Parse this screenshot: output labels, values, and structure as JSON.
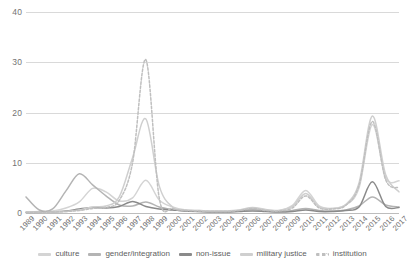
{
  "chart_data": {
    "type": "line",
    "title": "",
    "xlabel": "",
    "ylabel": "",
    "ylim": [
      0,
      40
    ],
    "yticks": [
      0,
      10,
      20,
      30,
      40
    ],
    "grid": true,
    "legend_position": "bottom",
    "categories": [
      "1989",
      "1990",
      "1991",
      "1992",
      "1993",
      "1994",
      "1995",
      "1996",
      "1997",
      "1998",
      "1999",
      "2000",
      "2001",
      "2002",
      "2003",
      "2004",
      "2005",
      "2006",
      "2007",
      "2008",
      "2009",
      "2010",
      "2011",
      "2012",
      "2013",
      "2014",
      "2015",
      "2016",
      "2017"
    ],
    "series": [
      {
        "name": "culture",
        "color": "#d4d4d4",
        "style": "solid",
        "values": [
          0.2,
          0.3,
          0.4,
          1.0,
          2.2,
          4.9,
          4.2,
          2.4,
          3.0,
          6.5,
          2.6,
          1.2,
          0.6,
          0.5,
          0.4,
          0.4,
          0.5,
          1.0,
          0.6,
          0.5,
          1.5,
          4.5,
          1.4,
          0.9,
          1.6,
          5.0,
          17.6,
          7.0,
          6.4
        ]
      },
      {
        "name": "gender/integration",
        "color": "#b4b4b4",
        "style": "solid",
        "values": [
          3.2,
          0.6,
          0.8,
          4.4,
          7.8,
          5.6,
          3.4,
          1.6,
          1.4,
          2.2,
          1.2,
          0.7,
          0.4,
          0.3,
          0.3,
          0.3,
          0.4,
          0.7,
          0.4,
          0.3,
          0.5,
          0.9,
          0.5,
          0.4,
          0.6,
          1.4,
          3.2,
          1.6,
          1.2
        ]
      },
      {
        "name": "non-issue",
        "color": "#8a8a8a",
        "style": "solid",
        "values": [
          0.1,
          0.1,
          0.2,
          0.4,
          0.8,
          1.1,
          1.0,
          1.3,
          2.3,
          1.3,
          0.8,
          0.6,
          0.4,
          0.3,
          0.2,
          0.2,
          0.3,
          0.4,
          0.3,
          0.2,
          0.3,
          0.6,
          0.3,
          0.3,
          0.5,
          1.2,
          6.2,
          1.3,
          1.1
        ]
      },
      {
        "name": "military justice",
        "color": "#cfcfcf",
        "style": "solid",
        "values": [
          0.1,
          0.1,
          0.2,
          0.3,
          0.6,
          1.2,
          1.4,
          3.2,
          11.0,
          18.7,
          5.4,
          1.2,
          0.6,
          0.5,
          0.4,
          0.4,
          0.6,
          1.1,
          0.7,
          0.5,
          1.3,
          3.9,
          1.2,
          0.9,
          1.7,
          6.0,
          19.3,
          7.6,
          4.2
        ]
      },
      {
        "name": "institution",
        "color": "#bfbfbf",
        "style": "dashed",
        "values": [
          0.1,
          0.1,
          0.2,
          0.3,
          0.5,
          0.9,
          1.1,
          2.5,
          10.0,
          30.5,
          3.0,
          0.9,
          0.5,
          0.4,
          0.3,
          0.3,
          0.5,
          0.9,
          0.5,
          0.4,
          1.0,
          3.4,
          1.0,
          0.8,
          1.5,
          5.5,
          18.2,
          6.6,
          5.0
        ]
      }
    ]
  }
}
